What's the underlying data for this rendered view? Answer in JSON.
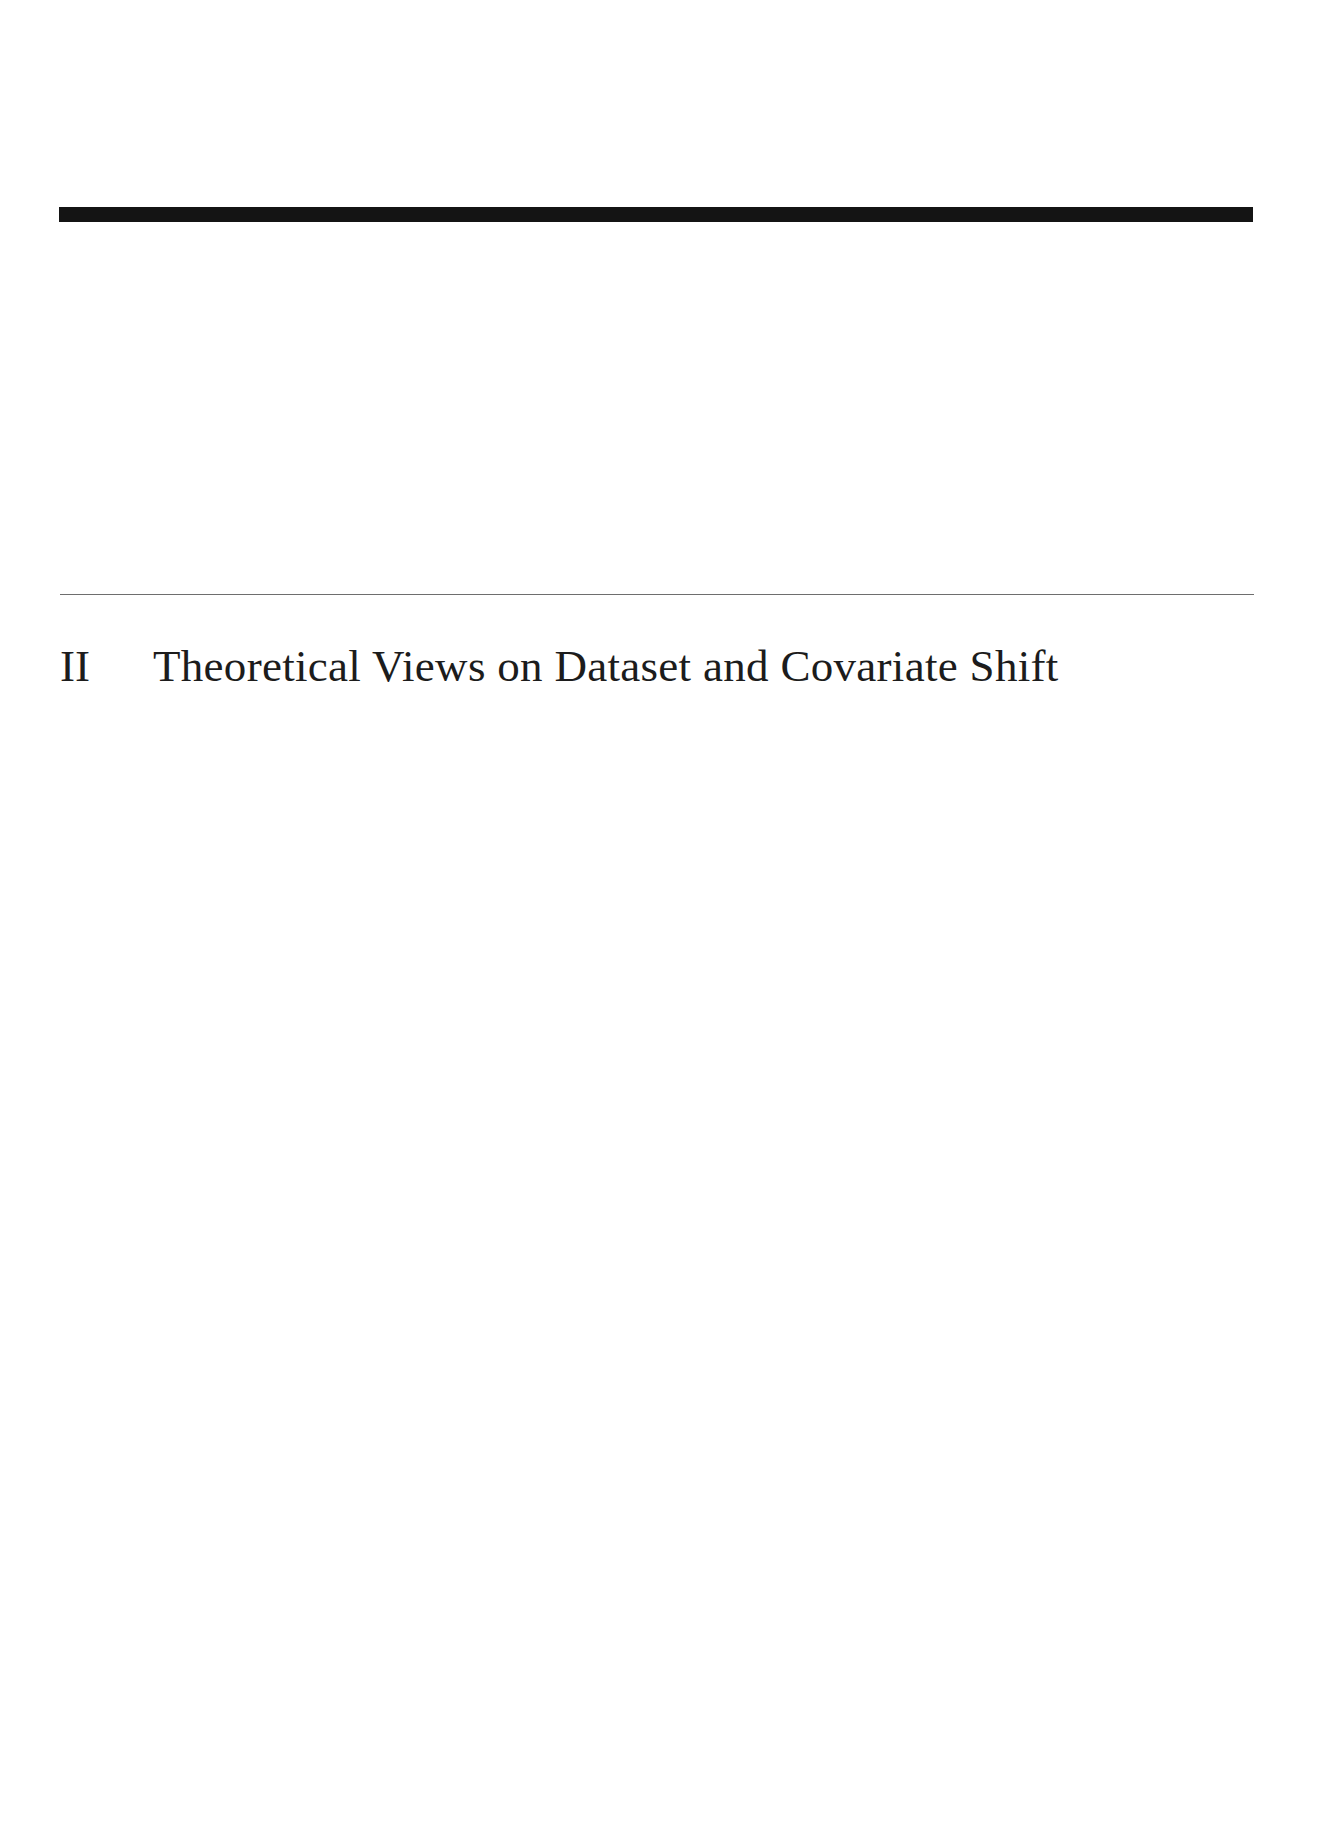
{
  "page": {
    "type": "part-title-page",
    "part": {
      "number": "II",
      "title": "Theoretical Views on Dataset and Covariate Shift"
    },
    "colors": {
      "background": "#ffffff",
      "top_bar": "#141414",
      "rule": "#6e6e6e",
      "text": "#1c1c1c"
    }
  }
}
